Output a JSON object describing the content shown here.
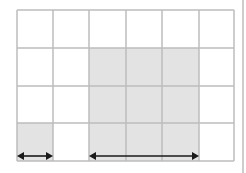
{
  "diagram": {
    "type": "grid-area-model",
    "grid": {
      "columns": 6,
      "rows": 4,
      "origin": [
        17,
        10
      ],
      "col_edges": [
        17,
        53,
        89,
        126,
        162,
        199,
        234
      ],
      "row_edges": [
        10,
        48,
        86,
        123,
        161
      ],
      "line_color": "#bcbcbc"
    },
    "shaded_regions": [
      {
        "name": "large-block",
        "col_start": 2,
        "col_end": 5,
        "row_start": 1,
        "row_end": 4
      },
      {
        "name": "small-block",
        "col_start": 0,
        "col_end": 1,
        "row_start": 3,
        "row_end": 4
      }
    ],
    "shade_color": "#e3e3e3",
    "arrows": [
      {
        "name": "width-arrow-small",
        "x1": 17,
        "x2": 53,
        "y": 156
      },
      {
        "name": "width-arrow-large",
        "x1": 89,
        "x2": 199,
        "y": 156
      }
    ],
    "arrow_color": "#1a1a1a",
    "separator": {
      "x": 243,
      "color": "#bcbcbc"
    }
  }
}
